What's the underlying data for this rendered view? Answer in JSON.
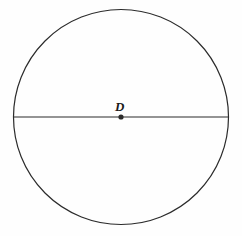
{
  "figure": {
    "type": "geometry-diagram",
    "background_color": "#fefefe",
    "stroke_color": "#2b2b2b",
    "label_color": "#1a1a1a",
    "canvas": {
      "width": 242,
      "height": 236
    },
    "shapes": {
      "circle": {
        "name": "circle",
        "center_x": 121,
        "center_y": 117,
        "radius": 107.5,
        "stroke_width": 1.2
      },
      "diameter": {
        "name": "horizontal-diameter-segment",
        "x1": 13.5,
        "y1": 117,
        "x2": 228.5,
        "y2": 117,
        "stroke_width": 1.2
      },
      "center_point": {
        "name": "center-point",
        "cx": 121,
        "cy": 117,
        "radius": 2.6
      }
    },
    "labels": {
      "center": {
        "text": "D",
        "x": 115,
        "y": 100
      }
    }
  },
  "chart_data": {
    "type": "scatter",
    "xlabel": "",
    "ylabel": "",
    "x": [
      121
    ],
    "y": [
      117
    ],
    "annotations": [
      "D"
    ],
    "grid": false,
    "legend": null
  }
}
